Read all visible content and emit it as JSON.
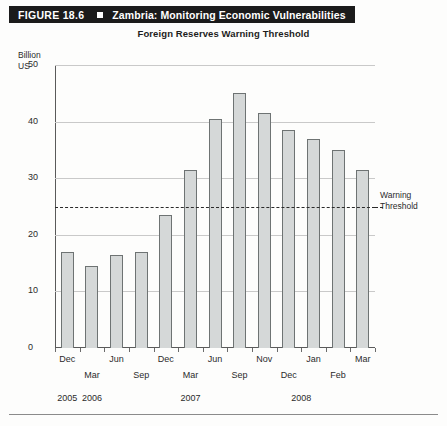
{
  "figure": {
    "number": "FIGURE 18.6",
    "separator_icon": "filled-square-icon",
    "title": "Zambria: Monitoring Economic Vulnerabilities"
  },
  "chart_data": {
    "type": "bar",
    "title": "Foreign Reserves Warning Threshold",
    "xlabel": "",
    "ylabel": "Billion US",
    "ylim": [
      0,
      50
    ],
    "yticks": [
      0,
      10,
      20,
      30,
      40,
      50
    ],
    "grid": true,
    "legend": "none",
    "categories": [
      "Dec 2005",
      "Mar 2006",
      "Jun 2006",
      "Sep 2006",
      "Dec 2006",
      "Mar 2007",
      "Jun 2007",
      "Sep 2007",
      "Nov 2007",
      "Dec 2007",
      "Jan 2008",
      "Feb 2008",
      "Mar 2008"
    ],
    "values": [
      17,
      14.5,
      16.5,
      17,
      23.5,
      31.5,
      40.5,
      45,
      41.5,
      38.5,
      37,
      35,
      31.5
    ],
    "annotations": [
      {
        "name": "warning-threshold",
        "label_line1": "Warning",
        "label_line2": "Threshold",
        "value": 25,
        "style": "dashed-horizontal-line"
      }
    ],
    "tick_rows": {
      "row_a": [
        "Dec",
        "Jun",
        "Dec",
        "Jun",
        "Nov",
        "Jan",
        "Mar"
      ],
      "row_b": [
        "Mar",
        "Sep",
        "Mar",
        "Sep",
        "Dec",
        "Feb"
      ],
      "years": [
        "2005",
        "2006",
        "2007",
        "2008"
      ]
    },
    "colors": {
      "bar_fill": "#d5d8d8",
      "bar_stroke": "#6e7373",
      "gridline": "#c9c9c9",
      "axis": "#5a5a5a",
      "threshold": "#2a2a2a",
      "header_bg": "#1b1b1b",
      "header_text": "#ffffff"
    }
  },
  "axis_labels": {
    "y_title_line1": "Billion",
    "y_title_line2": "US",
    "y_50": "50",
    "y_40": "40",
    "y_30": "30",
    "y_20": "20",
    "y_10": "10",
    "y_0": "0"
  },
  "x_ticks_row_a": [
    {
      "label": "Dec",
      "index": 0
    },
    {
      "label": "Jun",
      "index": 2
    },
    {
      "label": "Dec",
      "index": 4
    },
    {
      "label": "Jun",
      "index": 6
    },
    {
      "label": "Nov",
      "index": 8
    },
    {
      "label": "Jan",
      "index": 10
    },
    {
      "label": "Mar",
      "index": 12
    }
  ],
  "x_ticks_row_b": [
    {
      "label": "Mar",
      "index": 1
    },
    {
      "label": "Sep",
      "index": 3
    },
    {
      "label": "Mar",
      "index": 5
    },
    {
      "label": "Sep",
      "index": 7
    },
    {
      "label": "Dec",
      "index": 9
    },
    {
      "label": "Feb",
      "index": 11
    }
  ],
  "x_years": [
    {
      "label": "2005",
      "index": 0
    },
    {
      "label": "2006",
      "index": 1
    },
    {
      "label": "2007",
      "index": 5
    },
    {
      "label": "2008",
      "index": 9.5
    }
  ]
}
